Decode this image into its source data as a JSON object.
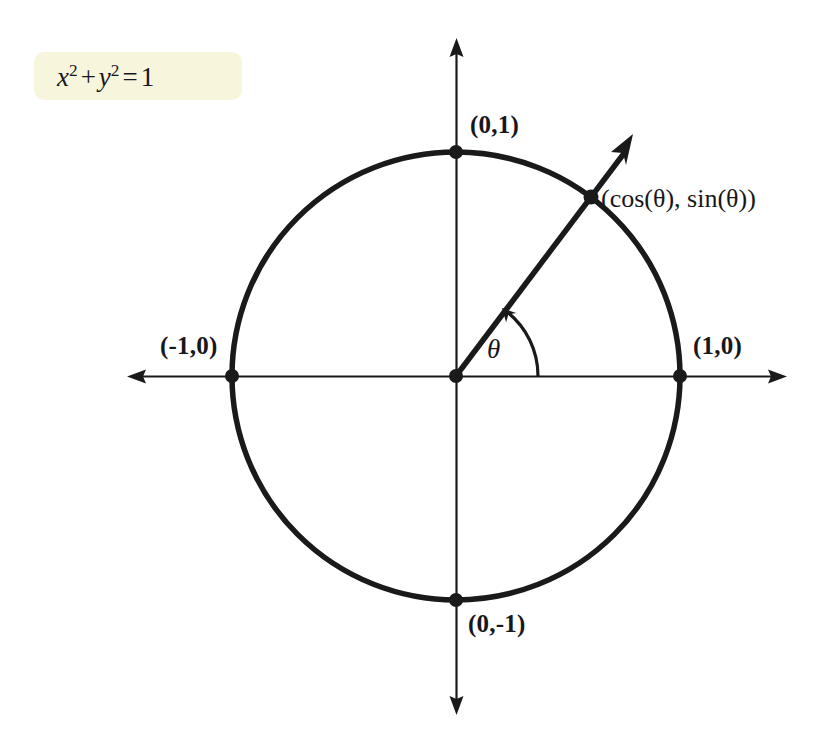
{
  "figure": {
    "background_color": "#ffffff",
    "ink_color": "#1a1a1a",
    "highlight_color": "#f7f6dd"
  },
  "equation": {
    "full_text": "x² + y² = 1",
    "x_var": "x",
    "x_exp": "2",
    "plus": "+",
    "y_var": "y",
    "y_exp": "2",
    "equals": "=",
    "rhs": "1",
    "highlight_color": "#f7f6dd"
  },
  "labels": {
    "top": "(0,1)",
    "right": "(1,0)",
    "left": "(-1,0)",
    "bottom": "(0,-1)",
    "point_on_circle": "(cos(θ), sin(θ))",
    "angle": "θ"
  },
  "geometry": {
    "center_x": 456,
    "center_y": 376,
    "radius": 224,
    "angle_degrees": 53,
    "x_axis_left_tip": 127,
    "x_axis_right_tip": 787,
    "y_axis_top_tip": 38,
    "y_axis_bottom_tip": 715,
    "arc_radius": 82
  },
  "points": [
    {
      "name": "origin",
      "label": "",
      "x": 456,
      "y": 376
    },
    {
      "name": "right-point",
      "label": "(1,0)",
      "x": 680,
      "y": 376
    },
    {
      "name": "left-point",
      "label": "(-1,0)",
      "x": 232,
      "y": 376
    },
    {
      "name": "top-point",
      "label": "(0,1)",
      "x": 456,
      "y": 152
    },
    {
      "name": "bottom-point",
      "label": "(0,-1)",
      "x": 456,
      "y": 600
    },
    {
      "name": "terminal-point",
      "label": "(cos(θ), sin(θ))",
      "x": 591,
      "y": 197
    }
  ]
}
